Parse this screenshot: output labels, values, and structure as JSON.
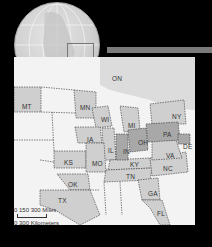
{
  "globe": {
    "highlight_box": "region-of-interest"
  },
  "map": {
    "states": [
      {
        "abbr": "ON",
        "x": 112,
        "y": 75,
        "shaded": false
      },
      {
        "abbr": "MT",
        "x": 22,
        "y": 103,
        "shaded": true
      },
      {
        "abbr": "MN",
        "x": 80,
        "y": 104,
        "shaded": true
      },
      {
        "abbr": "WI",
        "x": 101,
        "y": 116,
        "shaded": true
      },
      {
        "abbr": "MI",
        "x": 128,
        "y": 122,
        "shaded": true
      },
      {
        "abbr": "NY",
        "x": 172,
        "y": 113,
        "shaded": true
      },
      {
        "abbr": "IA",
        "x": 87,
        "y": 136,
        "shaded": true
      },
      {
        "abbr": "IL",
        "x": 108,
        "y": 147,
        "shaded": true
      },
      {
        "abbr": "IN",
        "x": 123,
        "y": 148,
        "shaded": true
      },
      {
        "abbr": "OH",
        "x": 138,
        "y": 139,
        "shaded": true
      },
      {
        "abbr": "PA",
        "x": 163,
        "y": 131,
        "shaded": true
      },
      {
        "abbr": "DE",
        "x": 183,
        "y": 143,
        "shaded": true
      },
      {
        "abbr": "KS",
        "x": 64,
        "y": 159,
        "shaded": true
      },
      {
        "abbr": "MO",
        "x": 92,
        "y": 160,
        "shaded": true
      },
      {
        "abbr": "VA",
        "x": 166,
        "y": 152,
        "shaded": true
      },
      {
        "abbr": "KY",
        "x": 130,
        "y": 161,
        "shaded": true
      },
      {
        "abbr": "NC",
        "x": 163,
        "y": 165,
        "shaded": true
      },
      {
        "abbr": "TN",
        "x": 126,
        "y": 173,
        "shaded": true
      },
      {
        "abbr": "OK",
        "x": 68,
        "y": 181,
        "shaded": true
      },
      {
        "abbr": "TX",
        "x": 58,
        "y": 197,
        "shaded": true
      },
      {
        "abbr": "GA",
        "x": 148,
        "y": 190,
        "shaded": true
      },
      {
        "abbr": "FL",
        "x": 157,
        "y": 210,
        "shaded": true
      }
    ],
    "scale": {
      "miles_label": "0   150  300 Miles",
      "km_label": "0    300 Kilometers"
    }
  },
  "colors": {
    "background": "#000000",
    "land": "#f3f3f3",
    "shaded": "#cfcfcf",
    "dark_shaded": "#a8a8a8",
    "water": "#d8d8d8"
  }
}
